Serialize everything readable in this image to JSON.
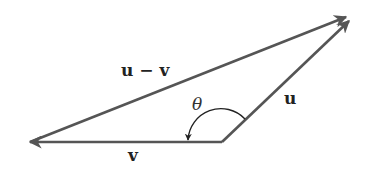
{
  "diagram": {
    "type": "vector-triangle",
    "colors": {
      "vector": "#555555",
      "arc": "#222222",
      "text": "#222222"
    },
    "vectors": [
      {
        "id": "u",
        "label": "u",
        "from": [
          222,
          142
        ],
        "to": [
          350,
          20
        ]
      },
      {
        "id": "v",
        "label": "v",
        "from": [
          222,
          142
        ],
        "to": [
          30,
          142
        ]
      },
      {
        "id": "u_minus_v",
        "label": "u − v",
        "from": [
          30,
          142
        ],
        "to": [
          347,
          16
        ]
      }
    ],
    "angle": {
      "label": "θ",
      "between": [
        "u",
        "v"
      ],
      "center": [
        222,
        142
      ],
      "radius": 30
    },
    "labels": {
      "u_minus_v": "u − v",
      "u": "u",
      "v": "v",
      "theta": "θ"
    }
  }
}
